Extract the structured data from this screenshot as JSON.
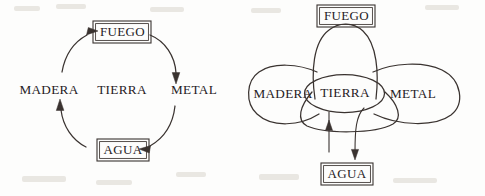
{
  "figure": {
    "background_color": "#fdfdfc",
    "ink_color": "#3a3330",
    "text_color": "#26211f",
    "panel_count": 2
  },
  "elements": {
    "fuego": "FUEGO",
    "tierra": "TIERRA",
    "madera": "MADERA",
    "metal": "METAL",
    "agua": "AGUA"
  },
  "left_diagram": {
    "name": "generation-cycle",
    "center_label": "TIERRA",
    "ring_labels": [
      "FUEGO",
      "METAL",
      "AGUA",
      "MADERA"
    ],
    "boxed_labels": [
      "FUEGO",
      "AGUA"
    ],
    "plain_labels": [
      "MADERA",
      "TIERRA",
      "METAL"
    ],
    "arrow_count": 4,
    "arrow_sequence": [
      {
        "from": "FUEGO",
        "to": "METAL",
        "direction": "clockwise-down-right"
      },
      {
        "from": "METAL",
        "to": "AGUA",
        "direction": "clockwise-down-left"
      },
      {
        "from": "AGUA",
        "to": "MADERA",
        "direction": "clockwise-up-left"
      },
      {
        "from": "MADERA",
        "to": "FUEGO",
        "direction": "clockwise-up-right"
      }
    ]
  },
  "right_diagram": {
    "name": "lobed-earth-center",
    "center_label": "TIERRA",
    "lobe_labels": [
      "FUEGO",
      "MADERA",
      "METAL"
    ],
    "boxed_labels": [
      "FUEGO",
      "AGUA"
    ],
    "lobe_count": 4,
    "lobe_positions": [
      "top",
      "left",
      "right",
      "bottom"
    ],
    "arrow_count": 2,
    "arrows": [
      {
        "label": "AGUA",
        "direction": "up",
        "side": "left"
      },
      {
        "label": "AGUA",
        "direction": "down",
        "side": "right"
      }
    ]
  }
}
